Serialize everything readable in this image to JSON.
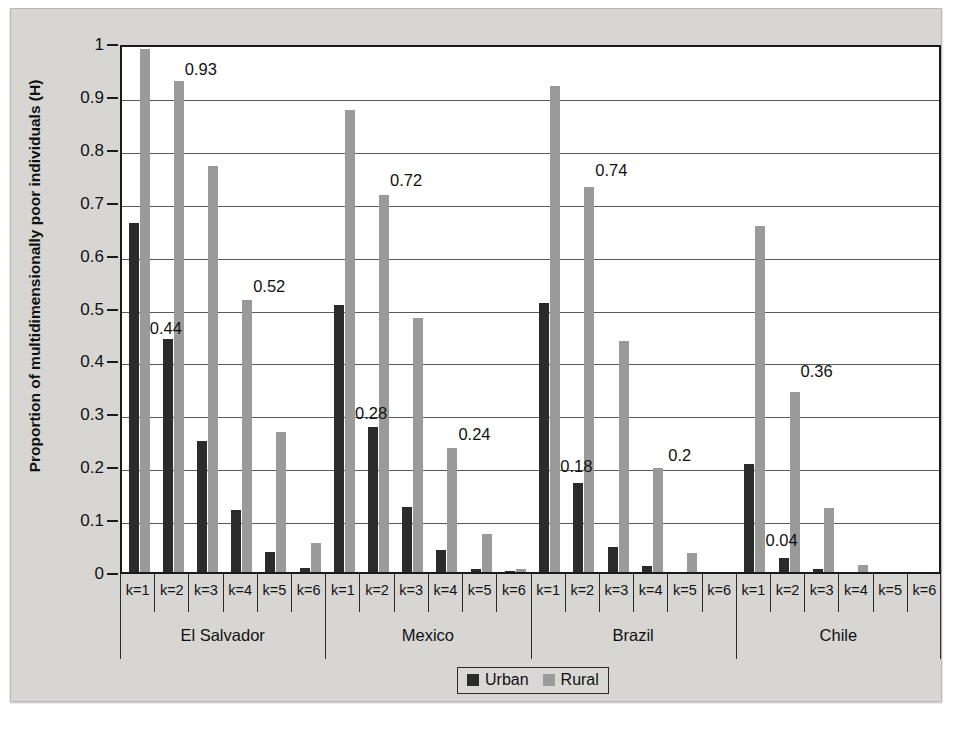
{
  "chart_data": {
    "type": "bar",
    "title": "",
    "xlabel": "",
    "ylabel": "Proportion of multidimensionally poor individuals (H)",
    "ylim": [
      0,
      1
    ],
    "yticks": [
      "0",
      "0.1",
      "0.2",
      "0.3",
      "0.4",
      "0.5",
      "0.6",
      "0.7",
      "0.8",
      "0.9",
      "1"
    ],
    "ytick_values": [
      0,
      0.1,
      0.2,
      0.3,
      0.4,
      0.5,
      0.6,
      0.7,
      0.8,
      0.9,
      1
    ],
    "grid": true,
    "legend_position": "bottom-center",
    "legend": [
      "Urban",
      "Rural"
    ],
    "categories": [
      "k=1",
      "k=2",
      "k=3",
      "k=4",
      "k=5",
      "k=6"
    ],
    "groups": [
      {
        "name": "El Salvador",
        "series": [
          {
            "name": "Urban",
            "values": [
              0.66,
              0.44,
              0.248,
              0.118,
              0.037,
              0.007
            ]
          },
          {
            "name": "Rural",
            "values": [
              0.988,
              0.928,
              0.767,
              0.515,
              0.265,
              0.055
            ]
          }
        ],
        "labels": [
          {
            "text": "0.93",
            "series": "Rural",
            "category": "k=2",
            "value": 0.93
          },
          {
            "text": "0.44",
            "series": "Urban",
            "category": "k=2",
            "value": 0.44
          },
          {
            "text": "0.52",
            "series": "Rural",
            "category": "k=4",
            "value": 0.52
          }
        ]
      },
      {
        "name": "Mexico",
        "series": [
          {
            "name": "Urban",
            "values": [
              0.504,
              0.275,
              0.123,
              0.042,
              0.005,
              0.001
            ]
          },
          {
            "name": "Rural",
            "values": [
              0.874,
              0.713,
              0.481,
              0.234,
              0.071,
              0.005
            ]
          }
        ],
        "labels": [
          {
            "text": "0.72",
            "series": "Rural",
            "category": "k=2",
            "value": 0.72
          },
          {
            "text": "0.28",
            "series": "Urban",
            "category": "k=2",
            "value": 0.28
          },
          {
            "text": "0.24",
            "series": "Rural",
            "category": "k=4",
            "value": 0.24
          }
        ]
      },
      {
        "name": "Brazil",
        "series": [
          {
            "name": "Urban",
            "values": [
              0.509,
              0.168,
              0.047,
              0.011,
              0.0,
              0.0
            ]
          },
          {
            "name": "Rural",
            "values": [
              0.918,
              0.728,
              0.436,
              0.196,
              0.036,
              0.0
            ]
          }
        ],
        "labels": [
          {
            "text": "0.74",
            "series": "Rural",
            "category": "k=2",
            "value": 0.74
          },
          {
            "text": "0.18",
            "series": "Urban",
            "category": "k=2",
            "value": 0.18
          },
          {
            "text": "0.2",
            "series": "Rural",
            "category": "k=4",
            "value": 0.2
          }
        ]
      },
      {
        "name": "Chile",
        "series": [
          {
            "name": "Urban",
            "values": [
              0.205,
              0.026,
              0.005,
              0.0,
              0.0,
              0.0
            ]
          },
          {
            "name": "Rural",
            "values": [
              0.654,
              0.341,
              0.121,
              0.013,
              0.0,
              0.0
            ]
          }
        ],
        "labels": [
          {
            "text": "0.36",
            "series": "Rural",
            "category": "k=2",
            "value": 0.36
          },
          {
            "text": "0.04",
            "series": "Urban",
            "category": "k=2",
            "value": 0.04
          }
        ]
      }
    ],
    "colors": {
      "urban": "#2b2b2b",
      "rural": "#9a9a9a",
      "axis": "#1a1a1a",
      "grid": "#5a5a5a",
      "plot_background": "#ffffff",
      "page_background": "#d7d6d2"
    }
  }
}
